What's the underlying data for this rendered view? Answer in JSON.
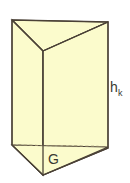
{
  "figure": {
    "kind": "triangular-prism",
    "caption_labels": {
      "height_label_main": "h",
      "height_label_subscript": "k",
      "base_label": "G"
    },
    "colors": {
      "background": "#ffffff",
      "face_fill_left": "#fbfbcc",
      "face_fill_right": "#fbfbcc",
      "face_fill_top": "#fbfbcc",
      "face_fill_base": "#fbfbcc",
      "edge_stroke": "#4a4136",
      "hidden_edge_stroke": "#8a7f63",
      "label_color": "#3a3a32"
    },
    "geometry": {
      "top_back_left": [
        12,
        20
      ],
      "top_back_right": [
        108,
        22
      ],
      "top_front_apex": [
        43,
        51
      ],
      "bottom_back_left": [
        12,
        145
      ],
      "bottom_back_right": [
        108,
        148
      ],
      "bottom_front_apex": [
        43,
        175
      ],
      "hidden_base_back_edge": [
        [
          12,
          145
        ],
        [
          108,
          145
        ]
      ]
    },
    "parts": [
      {
        "name": "top-face",
        "label": "top triangular face"
      },
      {
        "name": "left-face",
        "label": "left rectangular face"
      },
      {
        "name": "right-face",
        "label": "right rectangular face"
      },
      {
        "name": "base-face",
        "label": "bottom triangular base"
      },
      {
        "name": "hidden-base-edge",
        "label": "hidden back edge of base"
      }
    ],
    "label_positions": {
      "height_label": [
        110,
        90
      ],
      "height_subscript": [
        119,
        93
      ],
      "base_label": [
        48,
        163
      ]
    }
  }
}
